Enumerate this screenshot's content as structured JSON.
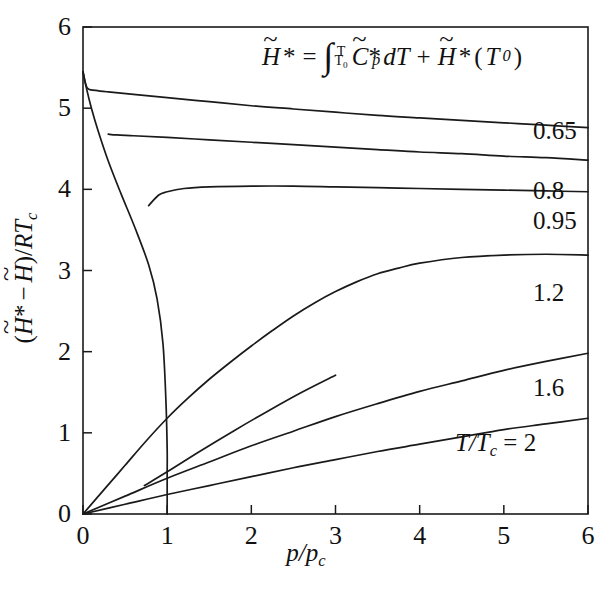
{
  "chart_data": {
    "type": "line",
    "title": "",
    "xlabel": "p/p_c",
    "ylabel": "(H~* - H~)/RT_c",
    "xlim": [
      0,
      6
    ],
    "ylim": [
      0,
      6
    ],
    "xticks": [
      0,
      1,
      2,
      3,
      4,
      5,
      6
    ],
    "yticks": [
      0,
      1,
      2,
      3,
      4,
      5,
      6
    ],
    "grid": false,
    "legend_position": "right-inline-labels",
    "annotation": "H~* = integral from T0 to T of C~*_p dT + H~*(T0)",
    "series": [
      {
        "name": "0.65",
        "label": "0.65",
        "x": [
          0.0,
          0.05,
          0.15,
          0.3,
          0.6,
          1.0,
          1.5,
          2.0,
          2.5,
          3.0,
          3.5,
          4.0,
          4.5,
          5.0,
          5.5,
          6.0
        ],
        "y": [
          5.45,
          5.25,
          5.22,
          5.2,
          5.17,
          5.13,
          5.08,
          5.03,
          4.99,
          4.95,
          4.91,
          4.88,
          4.85,
          4.82,
          4.79,
          4.76
        ]
      },
      {
        "name": "0.8",
        "label": "0.8",
        "x": [
          0.3,
          0.4,
          0.6,
          1.0,
          1.5,
          2.0,
          2.5,
          3.0,
          3.5,
          4.0,
          4.5,
          5.0,
          5.5,
          6.0
        ],
        "y": [
          4.68,
          4.67,
          4.66,
          4.64,
          4.61,
          4.58,
          4.55,
          4.52,
          4.49,
          4.46,
          4.44,
          4.41,
          4.39,
          4.36
        ]
      },
      {
        "name": "0.95",
        "label": "0.95",
        "x": [
          0.78,
          0.9,
          1.0,
          1.2,
          1.5,
          2.0,
          2.5,
          3.0,
          3.5,
          4.0,
          4.5,
          5.0,
          5.5,
          6.0
        ],
        "y": [
          3.8,
          3.93,
          3.97,
          4.01,
          4.03,
          4.04,
          4.04,
          4.03,
          4.02,
          4.01,
          4.0,
          3.99,
          3.98,
          3.97
        ]
      },
      {
        "name": "1.2",
        "label": "1.2",
        "x": [
          0.0,
          0.25,
          0.5,
          0.75,
          1.0,
          1.25,
          1.5,
          1.75,
          2.0,
          2.25,
          2.5,
          2.75,
          3.0,
          3.25,
          3.5,
          3.75,
          4.0,
          4.5,
          5.0,
          5.5,
          6.0
        ],
        "y": [
          0.0,
          0.3,
          0.6,
          0.9,
          1.18,
          1.43,
          1.66,
          1.87,
          2.07,
          2.26,
          2.44,
          2.6,
          2.74,
          2.86,
          2.96,
          3.03,
          3.09,
          3.16,
          3.19,
          3.2,
          3.19
        ]
      },
      {
        "name": "1.6",
        "label": "1.6",
        "x": [
          0.0,
          0.5,
          1.0,
          1.5,
          2.0,
          2.5,
          3.0,
          3.5,
          4.0,
          4.5,
          5.0,
          5.5,
          6.0
        ],
        "y": [
          0.0,
          0.22,
          0.44,
          0.64,
          0.84,
          1.02,
          1.2,
          1.36,
          1.51,
          1.64,
          1.77,
          1.88,
          1.98
        ]
      },
      {
        "name": "T/Tc = 2",
        "label": "T/T_c = 2",
        "x": [
          0.0,
          0.5,
          1.0,
          1.5,
          2.0,
          2.5,
          3.0,
          3.5,
          4.0,
          4.5,
          5.0,
          5.5,
          6.0
        ],
        "y": [
          0.0,
          0.12,
          0.24,
          0.35,
          0.46,
          0.57,
          0.67,
          0.77,
          0.86,
          0.95,
          1.04,
          1.11,
          1.18
        ]
      },
      {
        "name": "saturation-locus",
        "label": "",
        "x": [
          0.0,
          0.04,
          0.1,
          0.18,
          0.3,
          0.45,
          0.62,
          0.78,
          0.88,
          0.95,
          0.985,
          1.0,
          1.0,
          1.0,
          1.0
        ],
        "y": [
          5.45,
          5.25,
          5.0,
          4.72,
          4.35,
          3.95,
          3.52,
          3.07,
          2.65,
          2.1,
          1.4,
          0.8,
          0.5,
          0.25,
          0.0
        ]
      },
      {
        "name": "vapor-branch-lower",
        "label": "",
        "x": [
          0.73,
          1.0,
          1.4,
          1.8,
          2.2,
          2.6,
          3.0
        ],
        "y": [
          0.35,
          0.52,
          0.78,
          1.03,
          1.27,
          1.5,
          1.71
        ]
      }
    ]
  },
  "axes": {
    "x_title_parts": {
      "p": "p",
      "slash": "/",
      "p2": "p",
      "sub_c": "c"
    },
    "y_title_parts": {
      "open": "(",
      "h1": "H",
      "star1": "*",
      "minus": "−",
      "h2": "H",
      "close": ")",
      "slash": "/",
      "r": "R",
      "t": "T",
      "sub_c": "c"
    },
    "x_tick_labels": [
      "0",
      "1",
      "2",
      "3",
      "4",
      "5",
      "6"
    ],
    "y_tick_labels": [
      "0",
      "1",
      "2",
      "3",
      "4",
      "5",
      "6"
    ]
  },
  "equation": {
    "h_star_lhs": "H",
    "star1": "*",
    "equals": "=",
    "integral": "∫",
    "upper_limit": "T",
    "lower_limit": "T",
    "lower_limit_sub": "0",
    "c_symbol": "C",
    "c_star": "*",
    "c_sub_p": "p",
    "dT": "dT",
    "plus": "+",
    "h_star_rhs": "H",
    "star2": "*",
    "paren_open": "(",
    "t0": "T",
    "t0_sub": "0",
    "paren_close": ")"
  },
  "curve_labels": [
    {
      "text": "0.65",
      "left": 533,
      "top": 118
    },
    {
      "text": "0.8",
      "left": 533,
      "top": 178
    },
    {
      "text": "0.95",
      "left": 533,
      "top": 208
    },
    {
      "text": "1.2",
      "left": 533,
      "top": 280
    },
    {
      "text": "1.6",
      "left": 533,
      "top": 375
    },
    {
      "text": "T/Tc = 2",
      "left": 455,
      "top": 430
    }
  ],
  "style": {
    "line_color": "#1a1a1a",
    "background": "#ffffff",
    "text_color": "#111111"
  }
}
